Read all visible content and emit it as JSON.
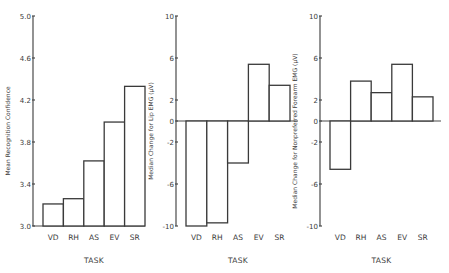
{
  "chart_data": [
    {
      "type": "bar",
      "title": "",
      "xlabel": "TASK",
      "ylabel": "Mean Recognition Confidence",
      "categories": [
        "VD",
        "RH",
        "AS",
        "EV",
        "SR"
      ],
      "values": [
        3.21,
        3.26,
        3.62,
        3.99,
        4.33
      ],
      "ylim": [
        3.0,
        5.0
      ],
      "yticks": [
        3.0,
        3.4,
        3.8,
        4.2,
        4.6,
        5.0
      ],
      "ytick_labels": [
        "3.0",
        "3.4",
        "3.8",
        "4.2",
        "4.6",
        "5.0"
      ],
      "grid": false,
      "legend": null
    },
    {
      "type": "bar",
      "title": "",
      "xlabel": "TASK",
      "ylabel": "Median Change for Lip EMG (μV)",
      "categories": [
        "VD",
        "RH",
        "AS",
        "EV",
        "SR"
      ],
      "values": [
        -10.0,
        -9.7,
        -4.0,
        5.4,
        3.4
      ],
      "ylim": [
        -10,
        10
      ],
      "yticks": [
        -10,
        -6,
        -2,
        0,
        2,
        6,
        10
      ],
      "ytick_labels": [
        "-10",
        "-6",
        "-2",
        "0",
        "2",
        "6",
        "10"
      ],
      "grid": false,
      "legend": null
    },
    {
      "type": "bar",
      "title": "",
      "xlabel": "TASK",
      "ylabel": "Median Change for Nonpreferred Forearm EMG (μV)",
      "categories": [
        "VD",
        "RH",
        "AS",
        "EV",
        "SR"
      ],
      "values": [
        -4.6,
        3.8,
        2.7,
        5.4,
        2.3
      ],
      "ylim": [
        -10,
        10
      ],
      "yticks": [
        -10,
        -6,
        -2,
        0,
        2,
        6,
        10
      ],
      "ytick_labels": [
        "-10",
        "-6",
        "-2",
        "0",
        "2",
        "6",
        "10"
      ],
      "grid": false,
      "legend": null
    }
  ],
  "panels": [
    {
      "axis_x": 33,
      "bar_start": 43,
      "bar_width": 20.4,
      "baseline_end": 145,
      "label_x": 30
    },
    {
      "axis_x": 176,
      "bar_start": 186,
      "bar_width": 20.8,
      "baseline_end": 298,
      "label_x": 173
    },
    {
      "axis_x": 320,
      "bar_start": 330,
      "bar_width": 20.6,
      "baseline_end": 441,
      "label_x": 317
    }
  ],
  "layout": {
    "y_top": 16,
    "y_bottom": 226,
    "cat_label_y": 240,
    "xlabel_y": 263
  }
}
